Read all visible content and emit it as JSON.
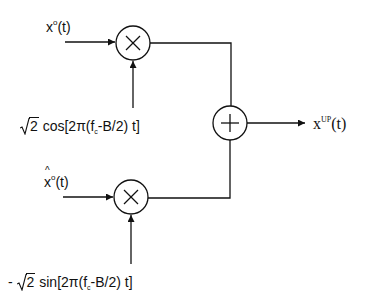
{
  "diagram": {
    "type": "block-diagram",
    "inputs": {
      "in_phase": {
        "label_base": "x",
        "label_sup": "o",
        "label_arg": "(t)",
        "text": "x^o(t)"
      },
      "quadrature": {
        "label_base": "x",
        "label_hat": true,
        "label_sup": "o",
        "label_arg": "(t)",
        "text": "x̂^o(t)"
      }
    },
    "carriers": {
      "cos": {
        "prefix": "",
        "sqrt_arg": "2",
        "func": " cos[2π(f",
        "sub": "c",
        "tail": "-B/2) t]",
        "text": "√2 cos[2π(f_c-B/2) t]"
      },
      "sin": {
        "prefix": "- ",
        "sqrt_arg": "2",
        "func": " sin[2π(f",
        "sub": "c",
        "tail": "-B/2) t]",
        "text": "- √2 sin[2π(f_c-B/2) t]"
      }
    },
    "blocks": [
      {
        "id": "mult1",
        "kind": "multiplier",
        "symbol": "×",
        "cx": 133,
        "cy": 43,
        "r": 17
      },
      {
        "id": "mult2",
        "kind": "multiplier",
        "symbol": "×",
        "cx": 131,
        "cy": 197,
        "r": 17
      },
      {
        "id": "sum",
        "kind": "adder",
        "symbol": "+",
        "cx": 230,
        "cy": 123,
        "r": 17
      }
    ],
    "output": {
      "label_base": "x",
      "label_sup": "UP",
      "label_arg": "(t)",
      "text": "x^UP(t)"
    },
    "stroke_color": "#111111",
    "background": "#ffffff"
  }
}
